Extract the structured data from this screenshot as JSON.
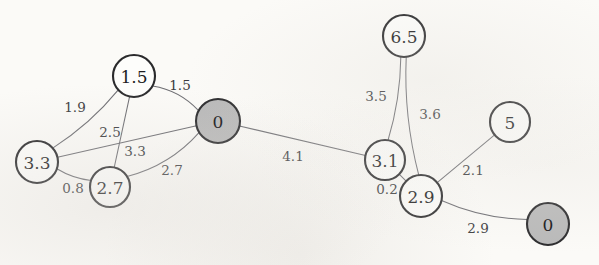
{
  "diagram": {
    "type": "undirected-weighted-graph",
    "background_color": "#fbfaf7",
    "node_stroke_color": "#2a2a2c",
    "node_fill_white": "#fdfdfb",
    "node_fill_gray": "#b9b9b9",
    "edge_color": "#6d6d72",
    "nodes": [
      {
        "id": "n1",
        "label": "1.5",
        "x": 134,
        "y": 76,
        "r": 21,
        "fill": "white"
      },
      {
        "id": "n2",
        "label": "0",
        "x": 218,
        "y": 121,
        "r": 22,
        "fill": "gray"
      },
      {
        "id": "n3",
        "label": "3.3",
        "x": 37,
        "y": 162,
        "r": 21,
        "fill": "white"
      },
      {
        "id": "n4",
        "label": "2.7",
        "x": 110,
        "y": 187,
        "r": 20,
        "fill": "white"
      },
      {
        "id": "n5",
        "label": "6.5",
        "x": 404,
        "y": 36,
        "r": 21,
        "fill": "white"
      },
      {
        "id": "n6",
        "label": "3.1",
        "x": 385,
        "y": 160,
        "r": 20,
        "fill": "white"
      },
      {
        "id": "n7",
        "label": "2.9",
        "x": 421,
        "y": 196,
        "r": 21,
        "fill": "white"
      },
      {
        "id": "n8",
        "label": "5",
        "x": 510,
        "y": 122,
        "r": 20,
        "fill": "white"
      },
      {
        "id": "n9",
        "label": "0",
        "x": 548,
        "y": 224,
        "r": 21,
        "fill": "gray"
      }
    ],
    "edges": [
      {
        "id": "e1",
        "from": "n1",
        "to": "n2",
        "weight": "1.5",
        "lx": 180,
        "ly": 85,
        "bend": -9
      },
      {
        "id": "e2",
        "from": "n1",
        "to": "n3",
        "weight": "1.9",
        "lx": 75,
        "ly": 107,
        "bend": -7
      },
      {
        "id": "e3",
        "from": "n1",
        "to": "n4",
        "weight": "2.5",
        "lx": 110,
        "ly": 132,
        "bend": 0
      },
      {
        "id": "e4",
        "from": "n3",
        "to": "n2",
        "weight": "3.3",
        "lx": 135,
        "ly": 151,
        "bend": 0
      },
      {
        "id": "e5",
        "from": "n3",
        "to": "n4",
        "weight": "0.8",
        "lx": 73,
        "ly": 188,
        "bend": 4
      },
      {
        "id": "e6",
        "from": "n4",
        "to": "n2",
        "weight": "2.7",
        "lx": 172,
        "ly": 170,
        "bend": 13
      },
      {
        "id": "e7",
        "from": "n2",
        "to": "n6",
        "weight": "4.1",
        "lx": 293,
        "ly": 156,
        "bend": 0
      },
      {
        "id": "e8",
        "from": "n5",
        "to": "n6",
        "weight": "3.5",
        "lx": 376,
        "ly": 96,
        "bend": -6
      },
      {
        "id": "e9",
        "from": "n5",
        "to": "n7",
        "weight": "3.6",
        "lx": 430,
        "ly": 114,
        "bend": 9
      },
      {
        "id": "e10",
        "from": "n6",
        "to": "n7",
        "weight": "0.2",
        "lx": 387,
        "ly": 189,
        "bend": 0
      },
      {
        "id": "e11",
        "from": "n7",
        "to": "n8",
        "weight": "2.1",
        "lx": 473,
        "ly": 170,
        "bend": 0
      },
      {
        "id": "e12",
        "from": "n7",
        "to": "n9",
        "weight": "2.9",
        "lx": 478,
        "ly": 228,
        "bend": 9
      }
    ]
  }
}
